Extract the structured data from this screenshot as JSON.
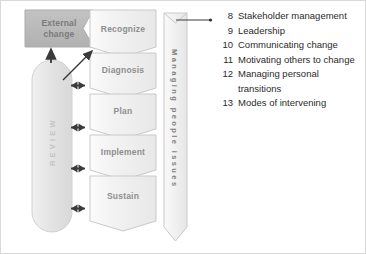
{
  "diagram": {
    "title_hidden": "",
    "external_change": {
      "label": "External\nchange",
      "line1": "External",
      "line2": "change",
      "fill": "#b9b9b9"
    },
    "review_bar": {
      "label": "REVIEW",
      "fill": "#e2e2e2"
    },
    "banner": {
      "label": "Managing people issues",
      "fill": "#f0f0f0"
    },
    "stages": [
      {
        "label": "Recognize"
      },
      {
        "label": "Diagnosis"
      },
      {
        "label": "Plan"
      },
      {
        "label": "Implement"
      },
      {
        "label": "Sustain"
      }
    ],
    "stage_fill": "#f1f1f1",
    "stage_stroke": "#c9c9c9",
    "connectors": {
      "double_arrow_count": 4,
      "up_arrow": "up-arrow",
      "diagonal_arrow": "diagonal-arrow",
      "leader_line": "leader-line"
    }
  },
  "issue_list": {
    "items": [
      {
        "num": "8",
        "text": "Stakeholder management"
      },
      {
        "num": "9",
        "text": "Leadership"
      },
      {
        "num": "10",
        "text": "Communicating change"
      },
      {
        "num": "11",
        "text": "Motivating others to change"
      },
      {
        "num": "12",
        "text": "Managing personal"
      },
      {
        "num": "",
        "text": "transitions"
      },
      {
        "num": "13",
        "text": "Modes of intervening"
      }
    ]
  },
  "colors": {
    "border": "#d9d9d9",
    "text": "#2b2b2b",
    "stage_text": "#8e8e8e",
    "dark_box": "#b9b9b9"
  }
}
